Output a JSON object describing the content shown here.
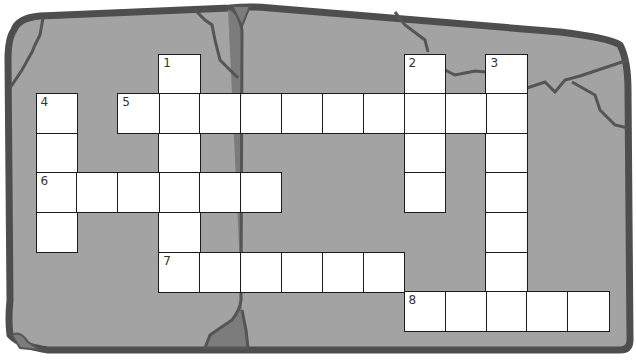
{
  "puzzle": {
    "type": "crossword",
    "cell_size": {
      "w": 40.9,
      "h": 39.6
    },
    "origin": {
      "x": 36,
      "y": 54
    },
    "colors": {
      "slab": "#a3a3a3",
      "slab_outline": "#4e4e4e",
      "crack": "#555555",
      "crack_fill": "#7c7c7c",
      "cell_bg": "#ffffff",
      "cell_border": "#1c1c1c"
    },
    "clue_numbers": [
      {
        "number": "1",
        "row": 0,
        "col": 3,
        "direction": "down",
        "length": 6
      },
      {
        "number": "2",
        "row": 0,
        "col": 9,
        "direction": "down",
        "length": 4
      },
      {
        "number": "3",
        "row": 0,
        "col": 11,
        "direction": "down",
        "length": 7
      },
      {
        "number": "4",
        "row": 1,
        "col": 0,
        "direction": "down",
        "length": 4
      },
      {
        "number": "5",
        "row": 1,
        "col": 2,
        "direction": "across",
        "length": 10
      },
      {
        "number": "6",
        "row": 3,
        "col": 0,
        "direction": "across",
        "length": 6
      },
      {
        "number": "7",
        "row": 5,
        "col": 3,
        "direction": "across",
        "length": 6
      },
      {
        "number": "8",
        "row": 6,
        "col": 9,
        "direction": "across",
        "length": 5
      }
    ]
  }
}
